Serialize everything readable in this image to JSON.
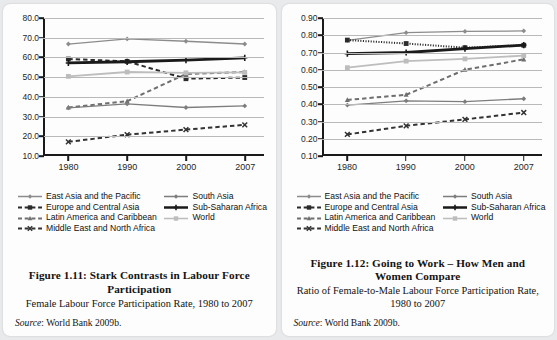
{
  "legend": {
    "column1": [
      {
        "label": "East Asia and the Pacific",
        "marker": "diamond",
        "dash": "solid",
        "color": "#8c8c8c",
        "width": 1.3
      },
      {
        "label": "Europe and Central Asia",
        "marker": "square",
        "dash": "dashed",
        "color": "#2b2b2b",
        "width": 1.8
      },
      {
        "label": "Latin America and Caribbean",
        "marker": "triangle",
        "dash": "dashed",
        "color": "#6f6f6f",
        "width": 1.8
      },
      {
        "label": "Middle East and North Africa",
        "marker": "x",
        "dash": "dashed",
        "color": "#333333",
        "width": 1.8
      }
    ],
    "column2": [
      {
        "label": "South Asia",
        "marker": "diamond",
        "dash": "solid",
        "color": "#7d7d7d",
        "width": 1.3
      },
      {
        "label": "Sub-Saharan Africa",
        "marker": "plus",
        "dash": "solid",
        "color": "#1a1a1a",
        "width": 2.6
      },
      {
        "label": "World",
        "marker": "square",
        "dash": "solid",
        "color": "#bdbdbd",
        "width": 1.6
      }
    ]
  },
  "left": {
    "caption_title": "Figure 1.11: Stark Contrasts in Labour Force Participation",
    "caption_sub": "Female Labour Force Participation Rate, 1980 to 2007",
    "source_label": "Source",
    "source_text": ": World Bank 2009b.",
    "chart_data": {
      "type": "line",
      "title": "Female Labour Force Participation Rate, 1980 to 2007",
      "xlabel": "",
      "ylabel": "",
      "x": [
        1980,
        1990,
        2000,
        2007
      ],
      "xtick_labels": [
        "1980",
        "1990",
        "2000",
        "2007"
      ],
      "ylim": [
        10.0,
        80.0
      ],
      "ytick_labels": [
        "10.0",
        "20.0",
        "30.0",
        "40.0",
        "50.0",
        "60.0",
        "70.0",
        "80.0"
      ],
      "yticks": [
        10,
        20,
        30,
        40,
        50,
        60,
        70,
        80
      ],
      "grid": true,
      "legend_position": "below",
      "series": [
        {
          "name": "East Asia and the Pacific",
          "values": [
            66.8,
            69.4,
            68.2,
            66.8
          ],
          "marker": "diamond",
          "dash": "solid",
          "color": "#8c8c8c",
          "width": 1.3
        },
        {
          "name": "Europe and Central Asia",
          "values": [
            59.2,
            58.0,
            49.2,
            49.8
          ],
          "marker": "square",
          "dash": "dashed",
          "color": "#2b2b2b",
          "width": 2.0
        },
        {
          "name": "Latin America and Caribbean",
          "values": [
            34.6,
            37.8,
            51.6,
            52.6
          ],
          "marker": "triangle",
          "dash": "dashed",
          "color": "#6f6f6f",
          "width": 2.0
        },
        {
          "name": "Middle East and North Africa",
          "values": [
            17.2,
            20.8,
            23.4,
            25.8
          ],
          "marker": "x",
          "dash": "dashed",
          "color": "#333333",
          "width": 2.0
        },
        {
          "name": "South Asia",
          "values": [
            34.4,
            36.4,
            34.6,
            35.4
          ],
          "marker": "diamond",
          "dash": "solid",
          "color": "#7d7d7d",
          "width": 1.3
        },
        {
          "name": "Sub-Saharan Africa",
          "values": [
            57.2,
            57.8,
            58.6,
            59.8
          ],
          "marker": "plus",
          "dash": "solid",
          "color": "#1a1a1a",
          "width": 2.8
        },
        {
          "name": "World",
          "values": [
            50.4,
            52.6,
            52.2,
            52.4
          ],
          "marker": "square",
          "dash": "solid",
          "color": "#bdbdbd",
          "width": 1.8
        }
      ]
    }
  },
  "right": {
    "caption_title": "Figure 1.12: Going to Work – How Men and Women Compare",
    "caption_sub": "Ratio of Female-to-Male Labour Force Participation Rate, 1980 to 2007",
    "source_label": "Source",
    "source_text": ": World Bank 2009b.",
    "chart_data": {
      "type": "line",
      "title": "Ratio of Female-to-Male Labour Force Participation Rate, 1980 to 2007",
      "xlabel": "",
      "ylabel": "",
      "x": [
        1980,
        1990,
        2000,
        2007
      ],
      "xtick_labels": [
        "1980",
        "1990",
        "2000",
        "2007"
      ],
      "ylim": [
        0.1,
        0.9
      ],
      "ytick_labels": [
        "0.10",
        "0.20",
        "0.30",
        "0.40",
        "0.50",
        "0.60",
        "0.70",
        "0.80",
        "0.90"
      ],
      "yticks": [
        0.1,
        0.2,
        0.3,
        0.4,
        0.5,
        0.6,
        0.7,
        0.8,
        0.9
      ],
      "grid": true,
      "legend_position": "below",
      "series": [
        {
          "name": "East Asia and the Pacific",
          "values": [
            0.77,
            0.815,
            0.822,
            0.825
          ],
          "marker": "diamond",
          "dash": "solid",
          "color": "#8c8c8c",
          "width": 1.3
        },
        {
          "name": "Europe and Central Asia",
          "values": [
            0.772,
            0.752,
            0.728,
            0.742
          ],
          "marker": "square",
          "dash": "dotted",
          "color": "#2b2b2b",
          "width": 2.0
        },
        {
          "name": "Latin America and Caribbean",
          "values": [
            0.425,
            0.455,
            0.6,
            0.66
          ],
          "marker": "triangle",
          "dash": "dashed",
          "color": "#6f6f6f",
          "width": 2.0
        },
        {
          "name": "Middle East and North Africa",
          "values": [
            0.225,
            0.275,
            0.312,
            0.352
          ],
          "marker": "x",
          "dash": "dashed",
          "color": "#333333",
          "width": 2.0
        },
        {
          "name": "South Asia",
          "values": [
            0.395,
            0.42,
            0.415,
            0.432
          ],
          "marker": "diamond",
          "dash": "solid",
          "color": "#7d7d7d",
          "width": 1.3
        },
        {
          "name": "Sub-Saharan Africa",
          "values": [
            0.693,
            0.7,
            0.722,
            0.743
          ],
          "marker": "plus",
          "dash": "solid",
          "color": "#1a1a1a",
          "width": 2.8
        },
        {
          "name": "World",
          "values": [
            0.612,
            0.65,
            0.663,
            0.682
          ],
          "marker": "square",
          "dash": "solid",
          "color": "#bdbdbd",
          "width": 1.8
        }
      ]
    }
  }
}
